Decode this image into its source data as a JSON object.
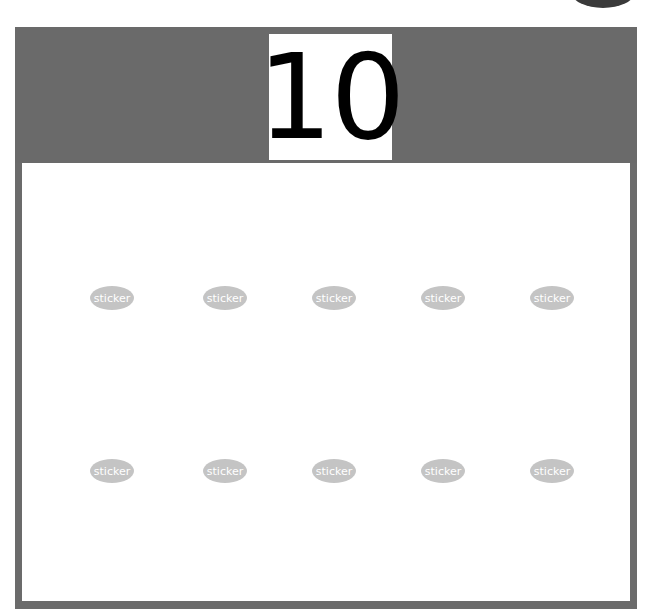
{
  "badge": {
    "text": ""
  },
  "header": {
    "number": "10"
  },
  "stickers": {
    "label": "sticker",
    "rows": [
      [
        "sticker",
        "sticker",
        "sticker",
        "sticker",
        "sticker"
      ],
      [
        "sticker",
        "sticker",
        "sticker",
        "sticker",
        "sticker"
      ]
    ]
  },
  "colors": {
    "frame": "#6b6b6b",
    "sticker": "#c4c4c4",
    "background": "#ffffff",
    "number": "#000000"
  }
}
